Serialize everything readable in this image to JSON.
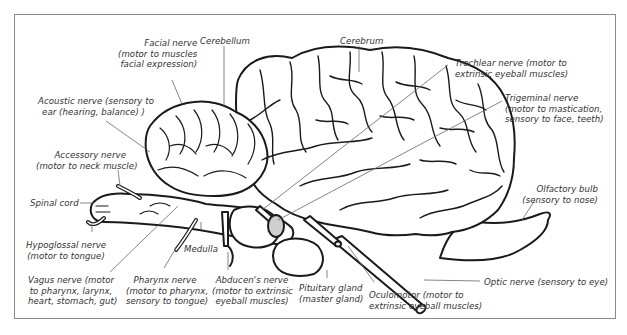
{
  "diagram": {
    "type": "labeled-anatomical-illustration",
    "labels": {
      "facial_nerve": "Facial nerve\n(motor to muscles\nfacial expression)",
      "cerebellum": "Cerebellum",
      "cerebrum": "Cerebrum",
      "trochlear_nerve": "Trochlear nerve (motor to\nextrinsic eyeball muscles)",
      "trigeminal_nerve": "Trigeminal nerve\n(motor to mastication,\nsensory to face, teeth)",
      "acoustic_nerve": "Acoustic nerve (sensory to\near (hearing, balance) )",
      "accessory_nerve": "Accessory nerve\n(motor to neck muscle)",
      "spinal_cord": "Spinal cord",
      "olfactory_bulb": "Olfactory bulb\n(sensory to nose)",
      "hypoglossal_nerve": "Hypoglossal nerve\n(motor to tongue)",
      "medulla": "Medulla",
      "vagus_nerve": "Vagus nerve (motor\nto pharynx, larynx,\nheart, stomach, gut)",
      "pharynx_nerve": "Pharynx nerve\n(motor to pharynx,\nsensory to tongue)",
      "abducens_nerve": "Abducen's nerve\n(motor to extrinsic\neyeball muscles)",
      "pituitary_gland": "Pituitary gland\n(master gland)",
      "oculomotor": "Oculomotor (motor to\nextrinsic eyeball muscles)",
      "optic_nerve": "Optic nerve (sensory to eye)"
    },
    "colors": {
      "outline": "#1a1a1a",
      "leader_line": "#666666",
      "text": "#333333",
      "frame": "#8a8a8a"
    }
  }
}
